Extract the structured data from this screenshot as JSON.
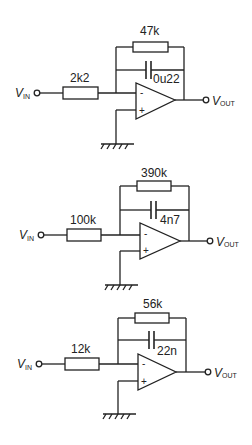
{
  "diagram": {
    "circuits": [
      {
        "input_label": "V",
        "input_sub": "IN",
        "output_label": "V",
        "output_sub": "OUT",
        "input_resistor": "2k2",
        "feedback_resistor": "47k",
        "feedback_capacitor": "0u22",
        "inverting_sign": "-",
        "noninverting_sign": "+"
      },
      {
        "input_label": "V",
        "input_sub": "IN",
        "output_label": "V",
        "output_sub": "OUT",
        "input_resistor": "100k",
        "feedback_resistor": "390k",
        "feedback_capacitor": "4n7",
        "inverting_sign": "-",
        "noninverting_sign": "+"
      },
      {
        "input_label": "V",
        "input_sub": "IN",
        "output_label": "V",
        "output_sub": "OUT",
        "input_resistor": "12k",
        "feedback_resistor": "56k",
        "feedback_capacitor": "22n",
        "inverting_sign": "-",
        "noninverting_sign": "+"
      }
    ]
  }
}
